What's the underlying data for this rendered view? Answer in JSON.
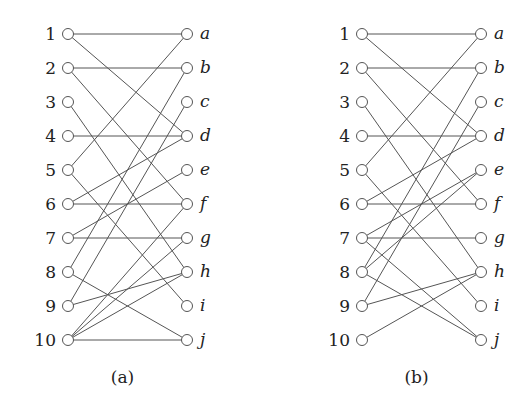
{
  "left_labels": [
    "1",
    "2",
    "3",
    "4",
    "5",
    "6",
    "7",
    "8",
    "9",
    "10"
  ],
  "right_labels": [
    "a",
    "b",
    "c",
    "d",
    "e",
    "f",
    "g",
    "h",
    "i",
    "j"
  ],
  "graphs": [
    {
      "caption": "(a)",
      "left_x": 68,
      "right_x": 187,
      "edges": [
        [
          "1",
          "a"
        ],
        [
          "1",
          "d"
        ],
        [
          "2",
          "b"
        ],
        [
          "2",
          "f"
        ],
        [
          "3",
          "h"
        ],
        [
          "4",
          "d"
        ],
        [
          "5",
          "a"
        ],
        [
          "5",
          "i"
        ],
        [
          "6",
          "d"
        ],
        [
          "6",
          "f"
        ],
        [
          "7",
          "e"
        ],
        [
          "7",
          "g"
        ],
        [
          "8",
          "b"
        ],
        [
          "8",
          "j"
        ],
        [
          "9",
          "c"
        ],
        [
          "9",
          "h"
        ],
        [
          "10",
          "f"
        ],
        [
          "10",
          "g"
        ],
        [
          "10",
          "h"
        ],
        [
          "10",
          "j"
        ]
      ]
    },
    {
      "caption": "(b)",
      "left_x": 362,
      "right_x": 481,
      "edges": [
        [
          "1",
          "a"
        ],
        [
          "1",
          "d"
        ],
        [
          "2",
          "b"
        ],
        [
          "2",
          "f"
        ],
        [
          "3",
          "h"
        ],
        [
          "4",
          "d"
        ],
        [
          "5",
          "a"
        ],
        [
          "5",
          "i"
        ],
        [
          "6",
          "d"
        ],
        [
          "6",
          "f"
        ],
        [
          "7",
          "e"
        ],
        [
          "7",
          "g"
        ],
        [
          "7",
          "j"
        ],
        [
          "8",
          "b"
        ],
        [
          "8",
          "e"
        ],
        [
          "8",
          "j"
        ],
        [
          "9",
          "c"
        ],
        [
          "9",
          "h"
        ],
        [
          "10",
          "h"
        ]
      ]
    }
  ],
  "layout": {
    "top_y": 34,
    "step_y": 34,
    "caption_y": 383,
    "node_r": 5.5
  }
}
